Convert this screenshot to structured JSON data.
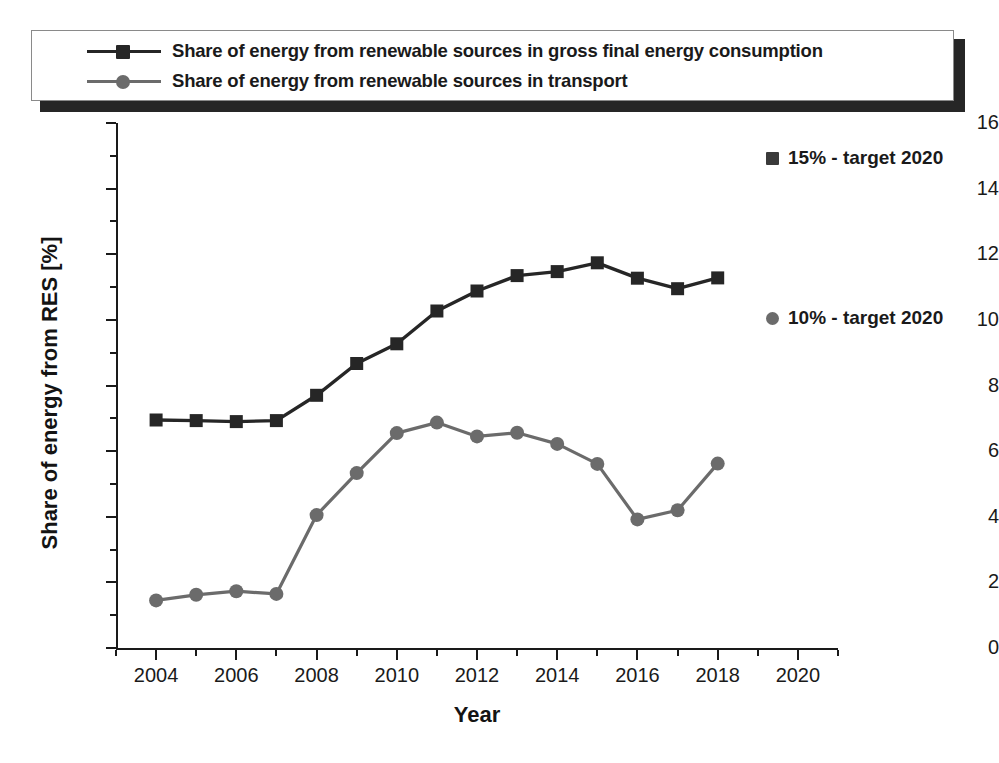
{
  "legend": {
    "entries": [
      {
        "label": "Share of energy from renewable sources in gross final energy consumption",
        "marker": "square-marker",
        "color": "#262626"
      },
      {
        "label": "Share of energy from renewable sources in transport",
        "marker": "circle-marker",
        "color": "#6b6b6b"
      }
    ]
  },
  "annotations": [
    {
      "id": "target-15",
      "label": "15% - target 2020",
      "marker": "square-marker",
      "color": "#3a3a3a"
    },
    {
      "id": "target-10",
      "label": "10% - target 2020",
      "marker": "circle-marker",
      "color": "#6b6b6b"
    }
  ],
  "axes": {
    "x_title": "Year",
    "y_title": "Share of energy from RES [%]",
    "x_ticks": [
      "2004",
      "2006",
      "2008",
      "2010",
      "2012",
      "2014",
      "2016",
      "2018",
      "2020"
    ],
    "y_ticks": [
      "0",
      "2",
      "4",
      "6",
      "8",
      "10",
      "12",
      "14",
      "16"
    ]
  },
  "chart_data": {
    "type": "line",
    "title": "",
    "xlabel": "Year",
    "ylabel": "Share of energy from RES [%]",
    "xlim": [
      2003,
      2021
    ],
    "ylim": [
      0,
      16
    ],
    "xticks": [
      2004,
      2006,
      2008,
      2010,
      2012,
      2014,
      2016,
      2018,
      2020
    ],
    "yticks": [
      0,
      2,
      4,
      6,
      8,
      10,
      12,
      14,
      16
    ],
    "minor_ticks": true,
    "grid": false,
    "legend_position": "top",
    "x": [
      2004,
      2005,
      2006,
      2007,
      2008,
      2009,
      2010,
      2011,
      2012,
      2013,
      2014,
      2015,
      2016,
      2017,
      2018
    ],
    "series": [
      {
        "name": "Share of energy from renewable sources in gross final energy consumption",
        "marker": "square",
        "color": "#262626",
        "values": [
          6.95,
          6.93,
          6.9,
          6.93,
          7.7,
          8.67,
          9.27,
          10.27,
          10.88,
          11.35,
          11.47,
          11.74,
          11.27,
          10.95,
          11.28
        ]
      },
      {
        "name": "Share of energy from renewable sources in transport",
        "marker": "circle",
        "color": "#6b6b6b",
        "values": [
          1.45,
          1.62,
          1.73,
          1.65,
          4.05,
          5.33,
          6.55,
          6.87,
          6.45,
          6.56,
          6.22,
          5.61,
          3.92,
          4.2,
          5.62
        ]
      }
    ],
    "annotations": [
      {
        "text": "15% - target 2020",
        "value": 15,
        "series": "gross final energy consumption"
      },
      {
        "text": "10% - target 2020",
        "value": 10,
        "series": "transport"
      }
    ]
  },
  "colors": {
    "series_dark": "#262626",
    "series_gray": "#6b6b6b",
    "axis": "#1a1a1a",
    "background": "#ffffff"
  }
}
